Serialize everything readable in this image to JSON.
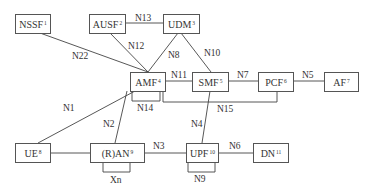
{
  "diagram": {
    "type": "5G network architecture (service-based reference point representation)",
    "nodes": [
      {
        "id": "nssf",
        "label": "NSSF",
        "sup": "1"
      },
      {
        "id": "ausf",
        "label": "AUSF",
        "sup": "2"
      },
      {
        "id": "udm",
        "label": "UDM",
        "sup": "3"
      },
      {
        "id": "amf",
        "label": "AMF",
        "sup": "4"
      },
      {
        "id": "smf",
        "label": "SMF",
        "sup": "5"
      },
      {
        "id": "pcf",
        "label": "PCF",
        "sup": "6"
      },
      {
        "id": "af",
        "label": "AF",
        "sup": "7"
      },
      {
        "id": "ue",
        "label": "UE",
        "sup": "8"
      },
      {
        "id": "ran",
        "label": "(R)AN",
        "sup": "9"
      },
      {
        "id": "upf",
        "label": "UPF",
        "sup": "10"
      },
      {
        "id": "dn",
        "label": "DN",
        "sup": "11"
      }
    ],
    "edges": [
      {
        "from": "ausf",
        "to": "udm",
        "label": "N13"
      },
      {
        "from": "nssf",
        "to": "amf",
        "label": "N22"
      },
      {
        "from": "ausf",
        "to": "amf",
        "label": "N12"
      },
      {
        "from": "udm",
        "to": "amf",
        "label": "N8"
      },
      {
        "from": "udm",
        "to": "smf",
        "label": "N10"
      },
      {
        "from": "amf",
        "to": "smf",
        "label": "N11"
      },
      {
        "from": "smf",
        "to": "pcf",
        "label": "N7"
      },
      {
        "from": "pcf",
        "to": "af",
        "label": "N5"
      },
      {
        "from": "amf",
        "to": "amf",
        "label": "N14"
      },
      {
        "from": "amf",
        "to": "pcf",
        "label": "N15"
      },
      {
        "from": "ue",
        "to": "amf",
        "label": "N1"
      },
      {
        "from": "ran",
        "to": "amf",
        "label": "N2"
      },
      {
        "from": "smf",
        "to": "upf",
        "label": "N4"
      },
      {
        "from": "ue",
        "to": "ran",
        "label": ""
      },
      {
        "from": "ran",
        "to": "upf",
        "label": "N3"
      },
      {
        "from": "upf",
        "to": "dn",
        "label": "N6"
      },
      {
        "from": "ran",
        "to": "ran",
        "label": "Xn"
      },
      {
        "from": "upf",
        "to": "upf",
        "label": "N9"
      }
    ]
  }
}
